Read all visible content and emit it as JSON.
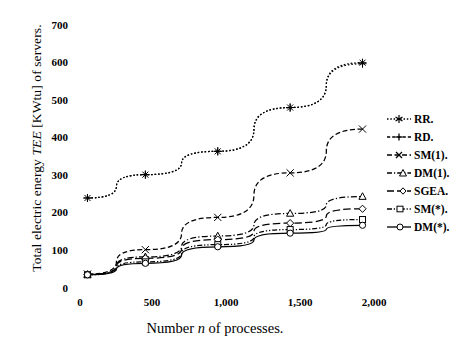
{
  "chart_data": {
    "type": "line",
    "title": "",
    "xlabel": "Number n of processes.",
    "xlabel_plain": "Number ",
    "xlabel_italic": "n",
    "xlabel_tail": " of processes.",
    "ylabel": "Total electric energy TEE [KWtu] of servers.",
    "ylabel_plain": "Total electric energy ",
    "ylabel_italic": "TEE",
    "ylabel_tail": " [KWtu] of servers.",
    "xlim": [
      0,
      2100
    ],
    "ylim": [
      0,
      730
    ],
    "xticks": [
      0,
      500,
      1000,
      1500,
      2000
    ],
    "xtick_labels": [
      "0",
      "500",
      "1,000",
      "1,500",
      "2,000"
    ],
    "yticks": [
      0,
      100,
      200,
      300,
      400,
      500,
      600,
      700
    ],
    "ytick_labels": [
      "0",
      "100",
      "200",
      "300",
      "400",
      "500",
      "600",
      "700"
    ],
    "grid": false,
    "legend_position": "right",
    "x": [
      100,
      500,
      1000,
      1500,
      2000
    ],
    "series": [
      {
        "name": "RR.",
        "values": [
          248,
          313,
          378,
          500,
          625
        ],
        "linestyle": "dotted",
        "marker": "asterisk",
        "color": "#000000"
      },
      {
        "name": "RD.",
        "values": [
          248,
          313,
          378,
          500,
          622
        ],
        "linestyle": "dotted",
        "marker": "plus",
        "color": "#000000"
      },
      {
        "name": "SM(1).",
        "values": [
          36,
          104,
          194,
          318,
          440
        ],
        "linestyle": "dashed",
        "marker": "x",
        "color": "#000000"
      },
      {
        "name": "DM(1).",
        "values": [
          35,
          84,
          142,
          205,
          252
        ],
        "linestyle": "dashdot",
        "marker": "triangle",
        "color": "#000000"
      },
      {
        "name": "SGEA.",
        "values": [
          35,
          80,
          132,
          178,
          218
        ],
        "linestyle": "dashed-long",
        "marker": "diamond",
        "color": "#000000"
      },
      {
        "name": "SM(*).",
        "values": [
          34,
          70,
          118,
          160,
          188
        ],
        "linestyle": "dashdotdot",
        "marker": "square",
        "color": "#000000"
      },
      {
        "name": "DM(*).",
        "values": [
          34,
          66,
          112,
          150,
          172
        ],
        "linestyle": "solid",
        "marker": "circle",
        "color": "#000000"
      }
    ]
  }
}
